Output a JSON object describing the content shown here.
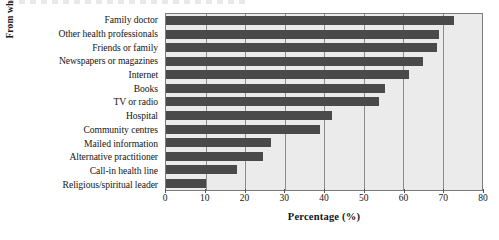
{
  "chart_data": {
    "type": "bar",
    "orientation": "horizontal",
    "title": "",
    "xlabel": "Percentage (%)",
    "ylabel": "From where health-related information was consulted",
    "xlim": [
      0,
      80
    ],
    "xticks": [
      0,
      10,
      20,
      30,
      40,
      50,
      60,
      70,
      80
    ],
    "xtick_labels": [
      "0",
      "10",
      "20",
      "30",
      "40",
      "50",
      "60",
      "70",
      "80"
    ],
    "grid": "vertical",
    "legend": "none",
    "categories": [
      "Family doctor",
      "Other health professionals",
      "Friends or family",
      "Newspapers or magazines",
      "Internet",
      "Books",
      "TV or radio",
      "Hospital",
      "Community centres",
      "Mailed information",
      "Alternative practitioner",
      "Call-in health line",
      "Religious/spiritual leader"
    ],
    "values": [
      73,
      69,
      68.5,
      65,
      61.5,
      55.5,
      54,
      42,
      39,
      26.5,
      24.5,
      18,
      10
    ],
    "colors": {
      "bar": "#4a4a4a",
      "plot_background": "#ebebeb",
      "gridline": "#8c8c8c",
      "axis": "#7a7a7a",
      "text": "#141414",
      "figure_background": "#ffffff"
    }
  }
}
